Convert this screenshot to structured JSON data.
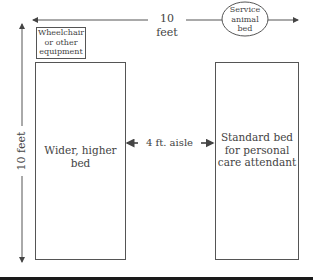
{
  "diagram": {
    "width_label": "10 feet",
    "height_label": "10 feet",
    "aisle_label": "4 ft. aisle",
    "left_bed_label": "Wider, higher bed",
    "right_bed_label": "Standard bed for personal care attendant",
    "equipment_label": "Wheelchair or other equipment",
    "service_animal_label": "Service animal bed",
    "colors": {
      "line": "#555555",
      "text": "#444444",
      "bottom_bar": "#1a1a1a"
    }
  }
}
